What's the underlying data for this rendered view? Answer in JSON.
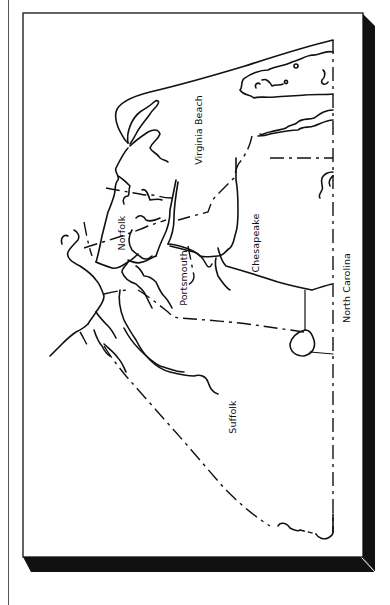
{
  "map": {
    "title": "",
    "region": "Hampton Roads, Virginia",
    "colors": {
      "background": "#ffffff",
      "lines": "#111111",
      "frame_shadow": "#111111"
    },
    "labels": {
      "virginia_beach": "Virginia Beach",
      "norfolk": "Norfolk",
      "portsmouth": "Portsmouth",
      "chesapeake": "Chesapeake",
      "suffolk": "Suffolk",
      "north_carolina": "North Carolina"
    },
    "orientation": "rotated 90 degrees counter-clockwise",
    "legend": {
      "solid_line": "coastline / waterways",
      "dashed_line": "city / state boundary"
    }
  }
}
